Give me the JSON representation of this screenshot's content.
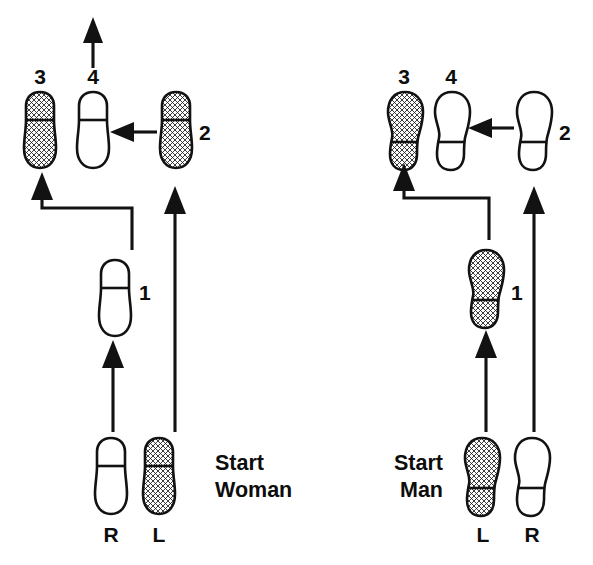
{
  "diagram": {
    "colors": {
      "ink": "#121212",
      "paper": "#ffffff",
      "shade": "#d9d9d9"
    },
    "panels": [
      {
        "id": "woman",
        "start_label_line1": "Start",
        "start_label_line2": "Woman",
        "foot_labels": {
          "left": "R",
          "right": "L"
        },
        "steps": [
          {
            "number": "1",
            "foot": "R",
            "shaded": false,
            "heel": "top"
          },
          {
            "number": "2",
            "foot": "L",
            "shaded": true,
            "heel": "top"
          },
          {
            "number": "3",
            "foot": "L",
            "shaded": true,
            "heel": "top"
          },
          {
            "number": "4",
            "foot": "R",
            "shaded": false,
            "heel": "top"
          }
        ],
        "start_feet": [
          {
            "foot": "R",
            "shaded": false,
            "heel": "top"
          },
          {
            "foot": "L",
            "shaded": true,
            "heel": "top"
          }
        ],
        "has_exit_arrow": true
      },
      {
        "id": "man",
        "start_label_line1": "Start",
        "start_label_line2": "Man",
        "foot_labels": {
          "left": "L",
          "right": "R"
        },
        "steps": [
          {
            "number": "1",
            "foot": "L",
            "shaded": true,
            "heel": "bottom"
          },
          {
            "number": "2",
            "foot": "R",
            "shaded": false,
            "heel": "bottom"
          },
          {
            "number": "3",
            "foot": "L",
            "shaded": true,
            "heel": "bottom"
          },
          {
            "number": "4",
            "foot": "R",
            "shaded": false,
            "heel": "bottom"
          }
        ],
        "start_feet": [
          {
            "foot": "L",
            "shaded": true,
            "heel": "bottom"
          },
          {
            "foot": "R",
            "shaded": false,
            "heel": "bottom"
          }
        ],
        "has_exit_arrow": false
      }
    ]
  },
  "labels": {
    "n1": "1",
    "n2": "2",
    "n3": "3",
    "n4": "4",
    "w_left_foot": "R",
    "w_right_foot": "L",
    "m_left_foot": "L",
    "m_right_foot": "R",
    "w_start1": "Start",
    "w_start2": "Woman",
    "m_start1": "Start",
    "m_start2": "Man",
    "mn1": "1",
    "mn2": "2",
    "mn3": "3",
    "mn4": "4"
  }
}
